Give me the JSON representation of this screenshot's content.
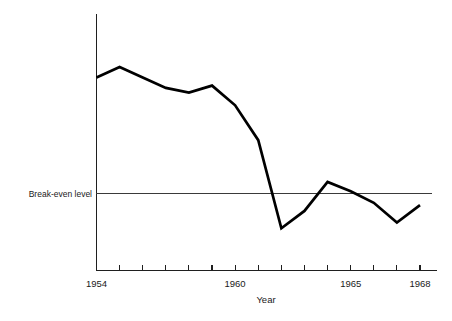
{
  "chart_data": {
    "type": "line",
    "title": "",
    "subtitle": "",
    "xlabel": "Year",
    "ylabel": "",
    "grid": false,
    "legend": "none",
    "x": [
      1954,
      1955,
      1956,
      1957,
      1958,
      1959,
      1960,
      1961,
      1962,
      1963,
      1964,
      1965,
      1966,
      1967,
      1968
    ],
    "x_tick_labels": [
      "1954",
      "",
      "",
      "",
      "",
      "",
      "1960",
      "",
      "",
      "",
      "",
      "1965",
      "",
      "",
      "1968"
    ],
    "x_ticks_labeled": [
      "1954",
      "1960",
      "1965",
      "1968"
    ],
    "xlim": [
      1954,
      1968
    ],
    "values": [
      10.0,
      10.9,
      10.0,
      9.1,
      8.7,
      9.3,
      7.6,
      4.6,
      -3.0,
      -1.5,
      1.0,
      0.2,
      -0.8,
      -2.5,
      -1.0
    ],
    "ylim": [
      -4.2,
      13.8
    ],
    "yunits": "relative to break-even level",
    "y_tick_labels": [],
    "annotations": [
      {
        "name": "break-even-reference",
        "label": "Break-even level",
        "value": 0,
        "orientation": "horizontal"
      }
    ],
    "series": [
      {
        "name": "profitability",
        "color": "#000000",
        "values": [
          10.0,
          10.9,
          10.0,
          9.1,
          8.7,
          9.3,
          7.6,
          4.6,
          -3.0,
          -1.5,
          1.0,
          0.2,
          -0.8,
          -2.5,
          -1.0
        ]
      }
    ]
  },
  "axes": {
    "x_title": "Year",
    "tick_labels": [
      {
        "year": "1954",
        "x": 1954
      },
      {
        "year": "1960",
        "x": 1960
      },
      {
        "year": "1965",
        "x": 1965
      },
      {
        "year": "1968",
        "x": 1968
      }
    ]
  },
  "reference": {
    "label": "Break-even level"
  },
  "colors": {
    "data_line": "#000000",
    "axis": "#1f1f1f",
    "reference_line": "#3a3a3a",
    "background": "#ffffff",
    "text": "#1a1a1a"
  }
}
